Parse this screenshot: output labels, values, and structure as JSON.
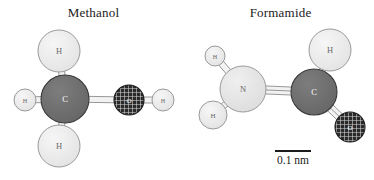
{
  "figure": {
    "background_color": "#ffffff",
    "panels": [
      {
        "id": "methanol",
        "title": "Methanol"
      },
      {
        "id": "formamide",
        "title": "Formamide"
      }
    ]
  },
  "scale_bar": {
    "label": "0.1 nm",
    "length_px": 36
  },
  "palette": {
    "carbon_fill": "#6e6e6e",
    "carbon_stroke": "#3a3a3a",
    "oxygen_fill": "#2a2a2a",
    "oxygen_hatch": "#e8e8e8",
    "nitrogen_fill": "#e4e4e4",
    "nitrogen_stroke": "#9a9a9a",
    "hydrogen_fill": "#ebebeb",
    "hydrogen_stroke": "#9a9a9a",
    "bond_fill": "#f2f2f2",
    "bond_stroke": "#8c8c8c",
    "label_dark": "#ffffff",
    "label_light": "#555555",
    "text_color": "#1a1a1a"
  },
  "chart_data": {
    "type": "diagram",
    "scale": "0.1 nm",
    "molecules": [
      {
        "name": "Methanol",
        "formula": "CH3OH",
        "atoms": [
          {
            "id": "m-c",
            "element": "C",
            "label": "C",
            "cx": 65,
            "cy": 99,
            "r": 24,
            "style": "carbon"
          },
          {
            "id": "m-h1",
            "element": "H",
            "label": "H",
            "cx": 59,
            "cy": 51,
            "r": 21,
            "style": "hydrogen"
          },
          {
            "id": "m-h2",
            "element": "H",
            "label": "H",
            "cx": 59,
            "cy": 146,
            "r": 21,
            "style": "hydrogen"
          },
          {
            "id": "m-h3",
            "element": "H",
            "label": "H",
            "cx": 25,
            "cy": 100,
            "r": 11,
            "style": "hydrogen"
          },
          {
            "id": "m-o",
            "element": "O",
            "label": "O",
            "cx": 129,
            "cy": 100,
            "r": 15,
            "style": "oxygen"
          },
          {
            "id": "m-h4",
            "element": "H",
            "label": "H",
            "cx": 163,
            "cy": 100,
            "r": 11,
            "style": "hydrogen"
          }
        ],
        "bonds": [
          {
            "from": "m-c",
            "to": "m-h1",
            "order": 1
          },
          {
            "from": "m-c",
            "to": "m-h2",
            "order": 1
          },
          {
            "from": "m-c",
            "to": "m-h3",
            "order": 1
          },
          {
            "from": "m-c",
            "to": "m-o",
            "order": 1
          },
          {
            "from": "m-o",
            "to": "m-h4",
            "order": 1
          }
        ]
      },
      {
        "name": "Formamide",
        "formula": "HCONH2",
        "atoms": [
          {
            "id": "f-n",
            "element": "N",
            "label": "N",
            "cx": 243,
            "cy": 89,
            "r": 23,
            "style": "nitrogen"
          },
          {
            "id": "f-c",
            "element": "C",
            "label": "C",
            "cx": 314,
            "cy": 92,
            "r": 23,
            "style": "carbon"
          },
          {
            "id": "f-o",
            "element": "O",
            "label": "O",
            "cx": 350,
            "cy": 127,
            "r": 15,
            "style": "oxygen"
          },
          {
            "id": "f-h1",
            "element": "H",
            "label": "H",
            "cx": 215,
            "cy": 56,
            "r": 10,
            "style": "hydrogen"
          },
          {
            "id": "f-h2",
            "element": "H",
            "label": "H",
            "cx": 213,
            "cy": 115,
            "r": 14,
            "style": "hydrogen"
          },
          {
            "id": "f-h3",
            "element": "H",
            "label": "H",
            "cx": 330,
            "cy": 50,
            "r": 21,
            "style": "hydrogen"
          }
        ],
        "bonds": [
          {
            "from": "f-n",
            "to": "f-c",
            "order": 2
          },
          {
            "from": "f-c",
            "to": "f-o",
            "order": 2
          },
          {
            "from": "f-n",
            "to": "f-h1",
            "order": 1
          },
          {
            "from": "f-n",
            "to": "f-h2",
            "order": 1
          },
          {
            "from": "f-c",
            "to": "f-h3",
            "order": 1
          }
        ]
      }
    ]
  }
}
